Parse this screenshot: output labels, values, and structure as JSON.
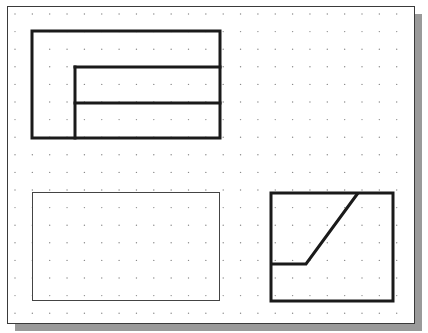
{
  "canvas": {
    "width": 428,
    "height": 333,
    "background": "#ffffff"
  },
  "frame": {
    "x": 7,
    "y": 6,
    "width": 407,
    "height": 317,
    "border_color": "#3a3a3a",
    "shadow": {
      "offset_x": 8,
      "offset_y": 8,
      "color": "#9a9a9a"
    }
  },
  "grid": {
    "dot_color": "#8a8a8a",
    "x_start": 15,
    "x_step": 17.35,
    "x_count": 23,
    "y_start": 14,
    "y_step": 17.6,
    "y_count": 18,
    "dot_radius": 0.7
  },
  "colors": {
    "thick_line": "#1a1a1a",
    "thin_line": "#444444"
  },
  "views": {
    "top_left": {
      "label": "front-view",
      "outer_rect": {
        "x": 32,
        "y": 31,
        "width": 188,
        "height": 107,
        "stroke_width": 3
      },
      "inner_lines": [
        {
          "x1": 75,
          "y1": 67,
          "x2": 220,
          "y2": 67
        },
        {
          "x1": 75,
          "y1": 103,
          "x2": 220,
          "y2": 103
        },
        {
          "x1": 75,
          "y1": 67,
          "x2": 75,
          "y2": 138
        }
      ]
    },
    "bottom_left": {
      "label": "empty-view-box",
      "rect": {
        "x": 32,
        "y": 192,
        "width": 187,
        "height": 108,
        "stroke_width": 1
      }
    },
    "bottom_right": {
      "label": "side-view",
      "rect": {
        "x": 271,
        "y": 193,
        "width": 122,
        "height": 108,
        "stroke_width": 3
      },
      "polyline": [
        [
          271,
          264
        ],
        [
          306,
          264
        ],
        [
          358,
          193
        ]
      ]
    }
  }
}
